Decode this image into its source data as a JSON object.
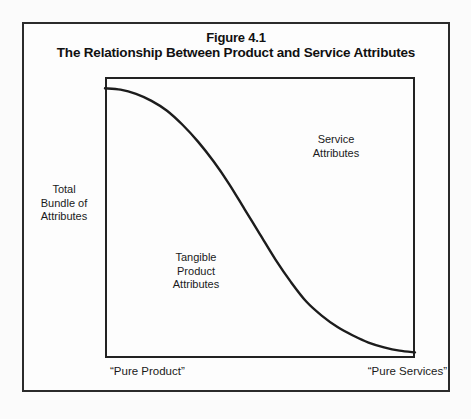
{
  "figure": {
    "caption_line_1": "Figure 4.1",
    "caption_line_2": "The Relationship Between Product and Service Attributes"
  },
  "labels": {
    "y_axis": "Total\nBundle of\nAttributes",
    "service_attributes": "Service\nAttributes",
    "tangible_product_attributes": "Tangible\nProduct\nAttributes",
    "x_axis_left": "“Pure Product”",
    "x_axis_right": "“Pure Services”"
  },
  "colors": {
    "frame": "#2b2b2b",
    "axis": "#222222",
    "curve": "#1c1c1c",
    "text": "#1a1a1a",
    "background": "#fbfbfb"
  },
  "chart_data": {
    "type": "line",
    "title": "The Relationship Between Product and Service Attributes",
    "xlabel": "",
    "ylabel": "Total Bundle of Attributes",
    "grid": false,
    "legend": null,
    "xlim": [
      0,
      100
    ],
    "ylim": [
      0,
      100
    ],
    "x_tick_labels": [
      "“Pure Product”",
      "“Pure Services”"
    ],
    "y_tick_labels": [],
    "annotations": [
      {
        "text": "Service Attributes",
        "x": 74,
        "y": 79
      },
      {
        "text": "Tangible Product Attributes",
        "x": 29,
        "y": 37
      }
    ],
    "series": [
      {
        "name": "Tangible product vs. service attribute mix",
        "x": [
          0,
          5,
          10,
          15,
          20,
          25,
          30,
          35,
          40,
          45,
          50,
          55,
          60,
          65,
          70,
          75,
          80,
          85,
          90,
          95,
          100
        ],
        "y": [
          96,
          95.5,
          94,
          91.5,
          88,
          83,
          77,
          70,
          62,
          53,
          44,
          35,
          27,
          20,
          15,
          11,
          8,
          5.5,
          3.8,
          2.6,
          2
        ]
      }
    ]
  }
}
